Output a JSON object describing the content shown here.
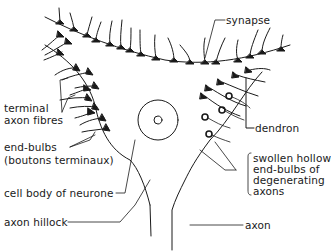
{
  "diagram": {
    "labels": {
      "synapse": "synapse",
      "terminal_axon_fibres_line1": "terminal",
      "terminal_axon_fibres_line2": "axon fibres",
      "end_bulbs_line1": "end-bulbs",
      "end_bulbs_line2": "(boutons terminaux)",
      "cell_body": "cell body of neurone",
      "axon_hillock": "axon hillock",
      "dendron": "dendron",
      "swollen_line1": "swollen hollow",
      "swollen_line2": "end-bulbs of",
      "swollen_line3": "degenerating",
      "swollen_line4": "axons",
      "axon": "axon"
    },
    "colors": {
      "ink": "#1a1a1a",
      "background": "#ffffff"
    }
  }
}
